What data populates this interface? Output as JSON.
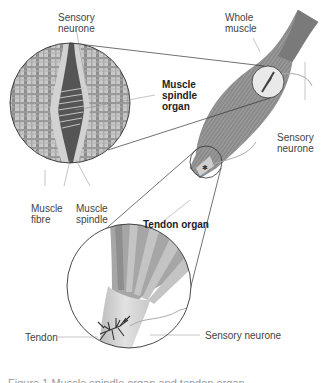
{
  "figure": {
    "labels": {
      "sensory_neurone_top": "Sensory\nneurone",
      "whole_muscle": "Whole\nmuscle",
      "muscle_spindle_organ": "Muscle\nspindle\norgan",
      "sensory_neurone_right": "Sensory\nneurone",
      "muscle_fibre": "Muscle\nfibre",
      "muscle_spindle": "Muscle\nspindle",
      "tendon_organ": "Tendon organ",
      "tendon": "Tendon",
      "sensory_neurone_bottom": "Sensory neurone"
    },
    "caption": "Figure 1  Muscle spindle organ and tendon organ"
  },
  "colors": {
    "muscle": "#8a8a8a",
    "muscle_dark": "#6e6e6e",
    "spindle": "#555555",
    "tendon": "#d4d4d4",
    "line": "#333333",
    "neurone": "#aaaaaa"
  }
}
